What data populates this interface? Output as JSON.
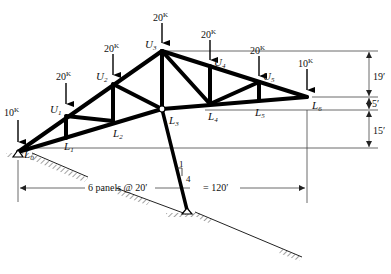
{
  "diagram": {
    "type": "roof truss with inclined strut support",
    "colors": {
      "member": "#000000",
      "dimension": "#333333",
      "background": "#ffffff"
    },
    "nodes": [
      {
        "id": "L0",
        "label": "L",
        "sub": "0"
      },
      {
        "id": "U1",
        "label": "U",
        "sub": "1"
      },
      {
        "id": "U2",
        "label": "U",
        "sub": "2"
      },
      {
        "id": "U3",
        "label": "U",
        "sub": "3"
      },
      {
        "id": "U4",
        "label": "U",
        "sub": "4"
      },
      {
        "id": "U5",
        "label": "U",
        "sub": "5"
      },
      {
        "id": "L1",
        "label": "L",
        "sub": "1"
      },
      {
        "id": "L2",
        "label": "L",
        "sub": "2"
      },
      {
        "id": "L3",
        "label": "L",
        "sub": "3"
      },
      {
        "id": "L4",
        "label": "L",
        "sub": "4"
      },
      {
        "id": "L5",
        "label": "L",
        "sub": "5"
      },
      {
        "id": "L6",
        "label": "L",
        "sub": "6"
      }
    ],
    "loads": [
      {
        "at": "L0",
        "value": "10",
        "unit": "K"
      },
      {
        "at": "U1",
        "value": "20",
        "unit": "K"
      },
      {
        "at": "U2",
        "value": "20",
        "unit": "K"
      },
      {
        "at": "U3",
        "value": "20",
        "unit": "K"
      },
      {
        "at": "U4",
        "value": "20",
        "unit": "K"
      },
      {
        "at": "U5",
        "value": "20",
        "unit": "K"
      },
      {
        "at": "L6",
        "value": "10",
        "unit": "K"
      }
    ],
    "dimensions": {
      "vertical": [
        "19′",
        "5′",
        "15′"
      ],
      "horizontal_left": "6 panels @ 20′",
      "horizontal_right": "= 120′"
    },
    "strut_slope": {
      "run": "1",
      "rise": "4"
    }
  }
}
